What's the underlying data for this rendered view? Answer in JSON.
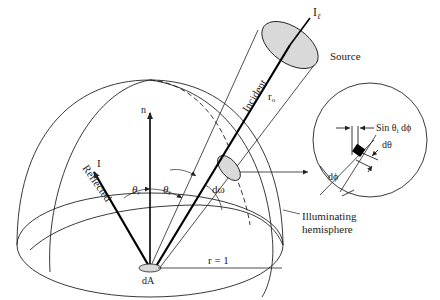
{
  "diagram": {
    "type": "bidirectional-reflectance-geometry",
    "labels": {
      "source_intensity": "I",
      "source_intensity_sub": "ℓ",
      "source": "Source",
      "incident": "Incident",
      "distance": "r",
      "distance_sub": "o",
      "normal": "n",
      "reflected_intensity": "I",
      "reflected": "Reflected",
      "theta_r": "θ",
      "theta_r_sub": "r",
      "theta_i": "θ",
      "theta_i_sub": "i",
      "solid_angle": "dω",
      "area": "dA",
      "radius": "r = 1",
      "hemisphere_line1": "Illuminating",
      "hemisphere_line2": "hemisphere",
      "inset_sin": "Sin θ",
      "inset_sin_sub": "i",
      "inset_sin_tail": " dϕ",
      "inset_dtheta": "dθ",
      "inset_dphi": "dϕ"
    },
    "colors": {
      "stroke": "#222222",
      "fill_gray": "#d9d9d9",
      "patch": "#000000"
    }
  }
}
